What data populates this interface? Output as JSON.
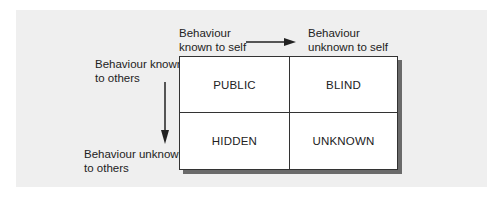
{
  "figure": {
    "axes": {
      "horizontal": {
        "from_label": "Behaviour known to self",
        "to_label": "Behaviour unknown to self",
        "from_lines": [
          "Behaviour",
          "known to self"
        ],
        "to_lines": [
          "Behaviour",
          "unknown to self"
        ]
      },
      "vertical": {
        "from_lines": [
          "Behaviour known",
          "to others"
        ],
        "to_lines": [
          "Behaviour unknown",
          "to others"
        ]
      }
    },
    "quadrants": [
      {
        "row": 0,
        "col": 0,
        "label": "PUBLIC"
      },
      {
        "row": 0,
        "col": 1,
        "label": "BLIND"
      },
      {
        "row": 1,
        "col": 0,
        "label": "HIDDEN"
      },
      {
        "row": 1,
        "col": 1,
        "label": "UNKNOWN"
      }
    ],
    "colors": {
      "panel_background": "#efefef",
      "grid_background": "#ffffff",
      "line_color": "#333333",
      "shadow_color": "#6a6a6a",
      "text_color": "#222222"
    }
  }
}
